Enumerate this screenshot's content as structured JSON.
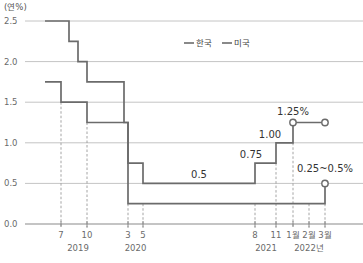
{
  "chart_data": {
    "type": "line",
    "title": "",
    "ylabel": "(연%)",
    "xlabel": "",
    "ylim": [
      0,
      2.5
    ],
    "yticks": [
      "0.0",
      "0.5",
      "1.0",
      "1.5",
      "2.0",
      "2.5"
    ],
    "ytick_values": [
      0,
      0.5,
      1.0,
      1.5,
      2.0,
      2.5
    ],
    "grid": true,
    "legend": {
      "position": "top-center",
      "entries": [
        "한국",
        "미국"
      ]
    },
    "x_ticks": [
      {
        "label": "7",
        "t": 2019.54
      },
      {
        "label": "10",
        "t": 2019.79
      },
      {
        "label": "3",
        "t": 2020.17
      },
      {
        "label": "5",
        "t": 2020.33
      },
      {
        "label": "8",
        "t": 2021.58
      },
      {
        "label": "11",
        "t": 2021.83
      },
      {
        "label": "1월",
        "t": 2022.0
      },
      {
        "label": "2월",
        "t": 2022.17
      },
      {
        "label": "3월",
        "t": 2022.33
      }
    ],
    "year_labels": [
      {
        "label": "2019",
        "t": 2019.67
      },
      {
        "label": "2020",
        "t": 2020.25
      },
      {
        "label": "2021",
        "t": 2021.71
      },
      {
        "label": "2022년",
        "t": 2022.17
      }
    ],
    "x_range": [
      2019.2,
      2022.33
    ],
    "series": [
      {
        "name": "한국",
        "color": "#6b6b6b",
        "steps": [
          {
            "t": 2019.37,
            "value": 1.75
          },
          {
            "t": 2019.54,
            "value": 1.5
          },
          {
            "t": 2019.79,
            "value": 1.25
          },
          {
            "t": 2020.17,
            "value": 0.75
          },
          {
            "t": 2020.33,
            "value": 0.5
          },
          {
            "t": 2021.58,
            "value": 0.75
          },
          {
            "t": 2021.83,
            "value": 1.0
          },
          {
            "t": 2022.0,
            "value": 1.25
          }
        ],
        "end_t": 2022.33,
        "markers": [
          2022.0,
          2022.33
        ]
      },
      {
        "name": "미국",
        "color": "#6b6b6b",
        "steps": [
          {
            "t": 2019.37,
            "value": 2.5
          },
          {
            "t": 2019.58,
            "value": 2.25
          },
          {
            "t": 2019.67,
            "value": 2.0
          },
          {
            "t": 2019.79,
            "value": 1.75
          },
          {
            "t": 2020.13,
            "value": 1.25
          },
          {
            "t": 2020.17,
            "value": 0.25
          },
          {
            "t": 2022.33,
            "value": 0.5
          }
        ],
        "end_t": 2022.33,
        "markers": [
          2022.33
        ]
      }
    ],
    "annotations": [
      {
        "text": "1.25%",
        "t": 2022.0,
        "value": 1.25
      },
      {
        "text": "1.00",
        "t": 2021.83,
        "value": 1.0
      },
      {
        "text": "0.75",
        "t": 2021.58,
        "value": 0.75
      },
      {
        "text": "0.5",
        "t": 2020.95,
        "value": 0.5
      },
      {
        "text": "0.25~0.5%",
        "t": 2022.33,
        "value": 0.5
      }
    ]
  }
}
